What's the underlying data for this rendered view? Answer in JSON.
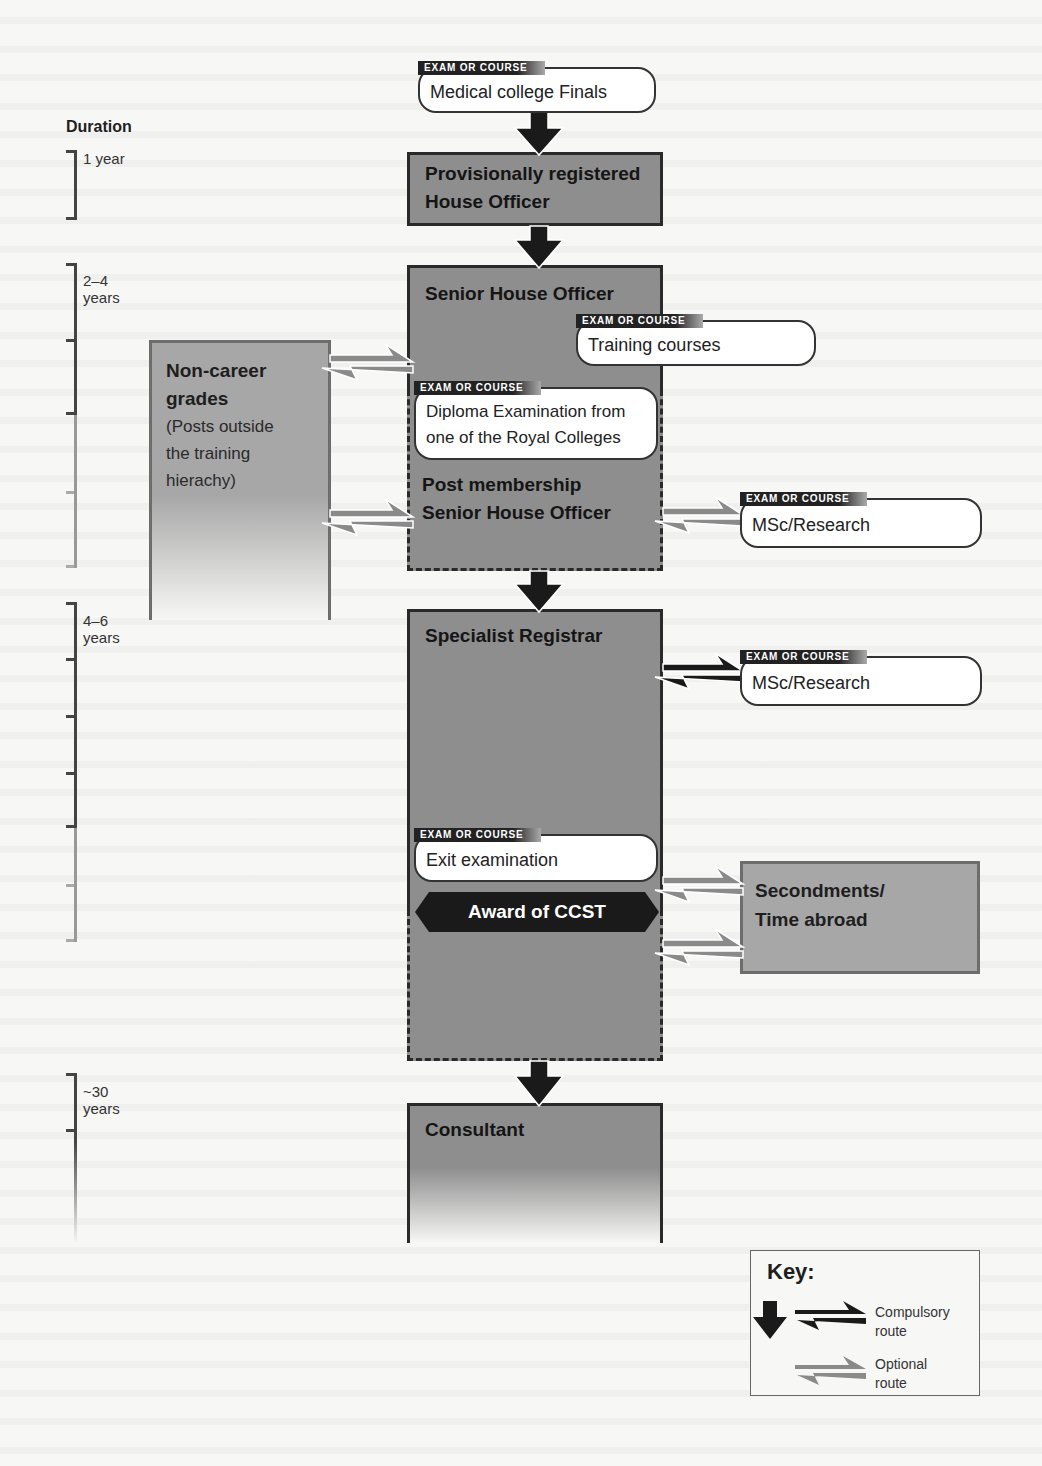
{
  "diagram": {
    "type": "career-flowchart",
    "duration": {
      "title": "Duration",
      "periods": [
        {
          "label_line1": "1 year",
          "label_line2": ""
        },
        {
          "label_line1": "2–4",
          "label_line2": "years"
        },
        {
          "label_line1": "4–6",
          "label_line2": "years"
        },
        {
          "label_line1": "~30",
          "label_line2": "years"
        }
      ]
    },
    "exam_tag": "EXAM OR COURSE",
    "exams": {
      "finals": "Medical college Finals",
      "training_courses": "Training courses",
      "diploma_line1": "Diploma Examination from",
      "diploma_line2": "one of the Royal Colleges",
      "msc_1": "MSc/Research",
      "msc_2": "MSc/Research",
      "exit": "Exit examination"
    },
    "stages": {
      "prho_line1": "Provisionally registered",
      "prho_line2": "House Officer",
      "sho": "Senior House Officer",
      "post_sho_line1": "Post membership",
      "post_sho_line2": "Senior House Officer",
      "spr": "Specialist Registrar",
      "consultant": "Consultant"
    },
    "side_boxes": {
      "noncareer_line1": "Non-career",
      "noncareer_line2": "grades",
      "noncareer_desc1": "(Posts outside",
      "noncareer_desc2": "the training",
      "noncareer_desc3": "hierachy)",
      "secondments_line1": "Secondments/",
      "secondments_line2": "Time abroad"
    },
    "milestone": "Award of CCST",
    "key": {
      "title": "Key:",
      "compulsory_line1": "Compulsory",
      "compulsory_line2": "route",
      "optional_line1": "Optional",
      "optional_line2": "route"
    },
    "colors": {
      "compulsory": "#1a1a1a",
      "optional": "#8a8a8a",
      "stage_fill": "#8e8e8e",
      "side_fill": "#a7a7a7"
    }
  }
}
